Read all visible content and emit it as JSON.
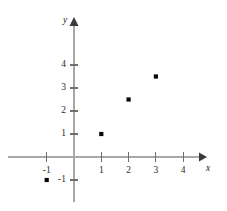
{
  "chart_data": {
    "type": "scatter",
    "title": "",
    "subtitle": "",
    "xlabel": "x",
    "ylabel": "y",
    "xlim": [
      -1.6,
      4.8
    ],
    "ylim": [
      -1.8,
      4.8
    ],
    "grid": false,
    "legend": null,
    "x_ticks": [
      {
        "value": -1,
        "label": "-1"
      },
      {
        "value": 1,
        "label": "1"
      },
      {
        "value": 2,
        "label": "2"
      },
      {
        "value": 3,
        "label": "3"
      },
      {
        "value": 4,
        "label": "4"
      }
    ],
    "y_ticks": [
      {
        "value": -1,
        "label": "-1"
      },
      {
        "value": 1,
        "label": "1"
      },
      {
        "value": 2,
        "label": "2"
      },
      {
        "value": 3,
        "label": "3"
      },
      {
        "value": 4,
        "label": "4"
      }
    ],
    "points": [
      {
        "x": -1,
        "y": -1
      },
      {
        "x": 1,
        "y": 1
      },
      {
        "x": 2,
        "y": 2.5
      },
      {
        "x": 3,
        "y": 3.5
      }
    ],
    "series": [
      {
        "name": "points",
        "marker": "square-dot",
        "color": "#070707",
        "x": [
          -1,
          1,
          2,
          3
        ],
        "values": [
          -1,
          1,
          2.5,
          3.5
        ]
      }
    ],
    "colors": {
      "axis": "#a8a8a8",
      "tick": "#6f6f6f",
      "text": "#2b2b2b",
      "point": "#070707",
      "background": "#ffffff"
    },
    "axes": {
      "x_axis_label": "x",
      "y_axis_label": "y",
      "x_arrow": true,
      "y_arrow": true
    }
  }
}
